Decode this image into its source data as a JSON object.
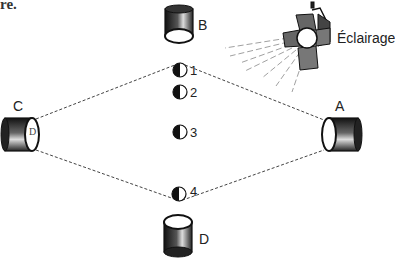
{
  "caption_fragment": "re.",
  "cameras": [
    {
      "id": "A",
      "label": "A"
    },
    {
      "id": "B",
      "label": "B"
    },
    {
      "id": "C",
      "label": "C"
    },
    {
      "id": "D",
      "label": "D"
    }
  ],
  "camera_c_lens_mark": "D",
  "light": {
    "label": "Éclairage",
    "icon": "spotlight-icon"
  },
  "moon_positions": [
    {
      "label": "1"
    },
    {
      "label": "2"
    },
    {
      "label": "3"
    },
    {
      "label": "4"
    }
  ],
  "colors": {
    "ink": "#222222",
    "dash": "#444444",
    "background": "#ffffff"
  }
}
